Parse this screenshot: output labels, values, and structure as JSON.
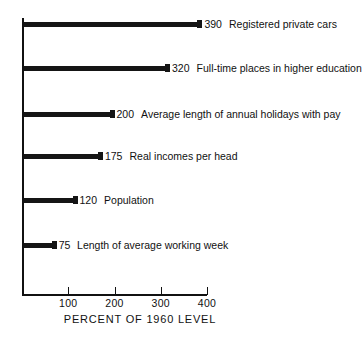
{
  "chart_data": {
    "type": "bar",
    "orientation": "horizontal",
    "title": "",
    "xlabel": "PERCENT OF 1960 LEVEL",
    "ylabel": "",
    "xlim": [
      0,
      400
    ],
    "grid": false,
    "legend": false,
    "categories": [
      "Registered private cars",
      "Full-time places in higher education",
      "Average length of annual holidays with pay",
      "Real incomes per head",
      "Population",
      "Length of average working week"
    ],
    "values": [
      390,
      320,
      200,
      175,
      120,
      75
    ],
    "value_labels": [
      "390",
      "320",
      "200",
      "175",
      "120",
      "75"
    ],
    "xticks": [
      100,
      200,
      300,
      400
    ],
    "xtick_labels": [
      "100",
      "200",
      "300",
      "400"
    ],
    "bar_color": "#151515",
    "axis_color": "#111111",
    "background": "#ffffff"
  },
  "bars": [
    {
      "value_label": "390",
      "value": 390,
      "category": "Registered private cars"
    },
    {
      "value_label": "320",
      "value": 320,
      "category": "Full-time places in higher education"
    },
    {
      "value_label": "200",
      "value": 200,
      "category": "Average length of annual holidays with pay"
    },
    {
      "value_label": "175",
      "value": 175,
      "category": "Real incomes per head"
    },
    {
      "value_label": "120",
      "value": 120,
      "category": "Population"
    },
    {
      "value_label": "75",
      "value": 75,
      "category": "Length of average working week"
    }
  ],
  "axis": {
    "title": "PERCENT OF 1960 LEVEL",
    "ticks": [
      {
        "label": "100",
        "value": 100
      },
      {
        "label": "200",
        "value": 200
      },
      {
        "label": "300",
        "value": 300
      },
      {
        "label": "400",
        "value": 400
      }
    ]
  }
}
